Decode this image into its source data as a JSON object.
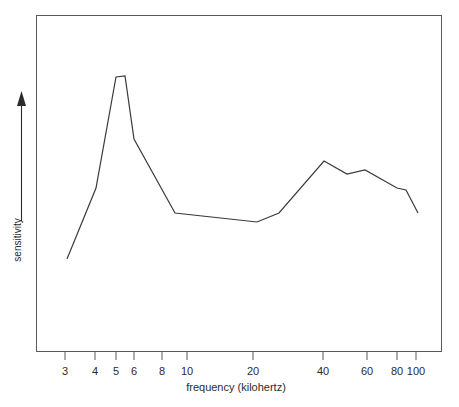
{
  "figure": {
    "kind": "line-plot",
    "background": "#ffffff",
    "line_color": "#3a3a3a",
    "frame_color": "#5a5a5a"
  },
  "chart_data": {
    "type": "line",
    "title": "",
    "subtitle": "",
    "xlabel": "frequency (kilohertz)",
    "ylabel": "sensitivity",
    "xscale": "log",
    "yscale": "linear",
    "grid": false,
    "legend": null,
    "xlim": [
      2.55,
      118
    ],
    "ylim": [
      0,
      1
    ],
    "xticks": [
      3,
      4,
      5,
      6,
      8,
      10,
      20,
      40,
      60,
      80,
      100
    ],
    "xticklabels": [
      "3",
      "4",
      "5",
      "6",
      "8",
      "10",
      "20",
      "40",
      "60",
      "80",
      "100"
    ],
    "yticks": [],
    "yticklabels": [],
    "y_axis_style": "arrow-only (unlabelled, increasing upward)",
    "series": [
      {
        "name": "sensitivity",
        "x": [
          3.15,
          4.2,
          5.0,
          5.45,
          6.0,
          9.0,
          19.5,
          24.5,
          39.5,
          48.0,
          57.0,
          79.0,
          88.0,
          101.0
        ],
        "y": [
          0.277,
          0.488,
          0.818,
          0.821,
          0.633,
          0.413,
          0.386,
          0.413,
          0.568,
          0.529,
          0.541,
          0.488,
          0.482,
          0.413
        ],
        "pixels": [
          [
            67,
            259
          ],
          [
            96,
            188
          ],
          [
            116,
            77
          ],
          [
            125,
            76
          ],
          [
            134,
            139
          ],
          [
            175,
            213
          ],
          [
            257,
            222
          ],
          [
            279,
            213
          ],
          [
            324,
            161
          ],
          [
            347,
            174
          ],
          [
            365,
            170
          ],
          [
            397,
            188
          ],
          [
            406,
            190
          ],
          [
            418,
            213
          ]
        ]
      }
    ],
    "annotations": []
  },
  "axis": {
    "x_title": "frequency (kilohertz)",
    "y_title": "sensitivity",
    "ticks": [
      {
        "label": "3",
        "x": 65
      },
      {
        "label": "4",
        "x": 95
      },
      {
        "label": "5",
        "x": 116
      },
      {
        "label": "6",
        "x": 134
      },
      {
        "label": "8",
        "x": 162
      },
      {
        "label": "10",
        "x": 187
      },
      {
        "label": "20",
        "x": 253
      },
      {
        "label": "40",
        "x": 323
      },
      {
        "label": "60",
        "x": 367
      },
      {
        "label": "80",
        "x": 397
      },
      {
        "label": "100",
        "x": 416
      }
    ]
  }
}
